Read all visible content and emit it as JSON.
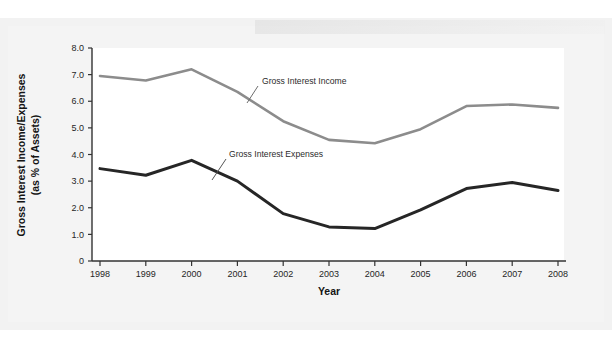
{
  "chart_data": {
    "type": "line",
    "title": "",
    "xlabel": "Year",
    "ylabel": "Gross Interest Income/Expenses (as % of Assets)",
    "ylabel_line1": "Gross Interest Income/Expenses",
    "ylabel_line2": "(as % of Assets)",
    "categories": [
      "1998",
      "1999",
      "2000",
      "2001",
      "2002",
      "2003",
      "2004",
      "2005",
      "2006",
      "2007",
      "2008"
    ],
    "x": [
      1998,
      1999,
      2000,
      2001,
      2002,
      2003,
      2004,
      2005,
      2006,
      2007,
      2008
    ],
    "xlim": [
      1998,
      2008
    ],
    "ylim": [
      0,
      8.0
    ],
    "yticks": [
      "8.0",
      "7.0",
      "6.0",
      "5.0",
      "4.0",
      "3.0",
      "2.0",
      "1.0",
      "0"
    ],
    "ytick_values": [
      8.0,
      7.0,
      6.0,
      5.0,
      4.0,
      3.0,
      2.0,
      1.0,
      0
    ],
    "grid": false,
    "legend_position": "inline-annotations",
    "series": [
      {
        "name": "Gross Interest Income",
        "color": "#8c8c8c",
        "values": [
          6.95,
          6.78,
          7.2,
          6.35,
          5.25,
          4.55,
          4.42,
          4.95,
          5.82,
          5.88,
          5.75
        ]
      },
      {
        "name": "Gross Interest Expenses",
        "color": "#262626",
        "values": [
          3.47,
          3.22,
          3.78,
          3.0,
          1.78,
          1.28,
          1.22,
          1.92,
          2.72,
          2.95,
          2.65
        ]
      }
    ],
    "annotations": [
      {
        "text": "Gross Interest Income",
        "x": 260,
        "y": 82
      },
      {
        "text": "Gross Interest Expenses",
        "x": 228,
        "y": 155
      }
    ]
  },
  "colors": {
    "income_line": "#8c8c8c",
    "expenses_line": "#262626",
    "axis": "#333333",
    "page_background": "#f2f2f2",
    "plot_background": "#ffffff"
  }
}
